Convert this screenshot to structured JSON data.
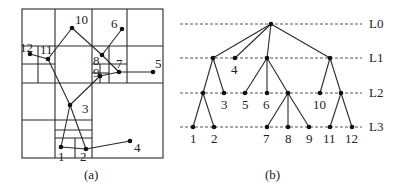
{
  "panel_a": {
    "caption": "(a)",
    "points": [
      {
        "id": "1",
        "label": "1"
      },
      {
        "id": "2",
        "label": "2"
      },
      {
        "id": "3",
        "label": "3"
      },
      {
        "id": "4",
        "label": "4"
      },
      {
        "id": "5",
        "label": "5"
      },
      {
        "id": "6",
        "label": "6"
      },
      {
        "id": "7",
        "label": "7"
      },
      {
        "id": "8",
        "label": "8"
      },
      {
        "id": "9",
        "label": "9"
      },
      {
        "id": "10",
        "label": "10"
      },
      {
        "id": "11",
        "label": "11"
      },
      {
        "id": "12",
        "label": "12"
      }
    ],
    "connections": [
      [
        "12",
        "11"
      ],
      [
        "11",
        "10"
      ],
      [
        "10",
        "8"
      ],
      [
        "8",
        "6"
      ],
      [
        "8",
        "7"
      ],
      [
        "7",
        "5"
      ],
      [
        "7",
        "9"
      ],
      [
        "9",
        "3"
      ],
      [
        "11",
        "3"
      ],
      [
        "3",
        "1"
      ],
      [
        "3",
        "2"
      ],
      [
        "1",
        "2"
      ],
      [
        "2",
        "4"
      ]
    ]
  },
  "panel_b": {
    "caption": "(b)",
    "levels": [
      "L0",
      "L1",
      "L2",
      "L3"
    ],
    "leaf_labels": {
      "n4": "4",
      "n3": "3",
      "n5": "5",
      "n6": "6",
      "n10": "10",
      "n1": "1",
      "n2": "2",
      "n7": "7",
      "n8": "8",
      "n9": "9",
      "n11": "11",
      "n12": "12"
    },
    "tree": {
      "root": [
        "A",
        "n4",
        "B",
        "C"
      ],
      "A": [
        "D",
        "n3"
      ],
      "D": [
        "n1",
        "n2"
      ],
      "B": [
        "n5",
        "n6",
        "E"
      ],
      "E": [
        "n7",
        "n8",
        "n9"
      ],
      "C": [
        "n10",
        "F"
      ],
      "F": [
        "n11",
        "n12"
      ]
    }
  }
}
